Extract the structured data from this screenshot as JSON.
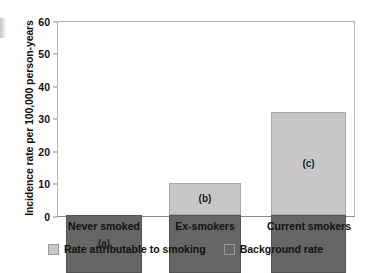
{
  "chart_data": {
    "type": "bar",
    "subtype": "stacked-bar",
    "title": "",
    "xlabel": "",
    "ylabel": "Incidence rate per 100,000 person-years",
    "categories": [
      "Never smoked",
      "Ex-smokers",
      "Current smokers"
    ],
    "series": [
      {
        "name": "Background rate",
        "color": "#666666",
        "values": [
          17.8,
          17.8,
          17.8
        ]
      },
      {
        "name": "Rate attributable to smoking",
        "color": "#c7c7c7",
        "values": [
          0,
          9.9,
          31.7
        ]
      }
    ],
    "totals": [
      17.8,
      27.7,
      49.5
    ],
    "annotations": [
      "(a)",
      "(b)",
      "(c)"
    ],
    "ylim": [
      0,
      60
    ],
    "yticks": [
      "0",
      "10",
      "20",
      "30",
      "40",
      "50",
      "60"
    ],
    "ytick_values": [
      0,
      10,
      20,
      30,
      40,
      50,
      60
    ],
    "grid": false,
    "legend_position": "bottom",
    "legend": [
      {
        "label": "Rate attributable to smoking",
        "color": "#c7c7c7"
      },
      {
        "label": "Background rate",
        "color": "#666666"
      }
    ]
  },
  "axes": {
    "y_title": "Incidence rate per 100,000 person-years",
    "tick_labels": [
      "60",
      "50",
      "40",
      "30",
      "20",
      "10",
      "0"
    ],
    "category_labels": [
      "Never smoked",
      "Ex-smokers",
      "Current smokers"
    ]
  },
  "bars": [
    {
      "annotation": "(a)",
      "background": 17.8,
      "attributable": 0,
      "total": 17.8
    },
    {
      "annotation": "(b)",
      "background": 17.8,
      "attributable": 9.9,
      "total": 27.7
    },
    {
      "annotation": "(c)",
      "background": 17.8,
      "attributable": 31.7,
      "total": 49.5
    }
  ],
  "legend": {
    "entries": [
      {
        "label": "Rate attributable to smoking",
        "color": "#c7c7c7"
      },
      {
        "label": "Background rate",
        "color": "#666666"
      }
    ]
  },
  "colors": {
    "background_rate": "#666666",
    "attributable_rate": "#c7c7c7",
    "frame": "#b5b5b5",
    "text": "#111111"
  }
}
